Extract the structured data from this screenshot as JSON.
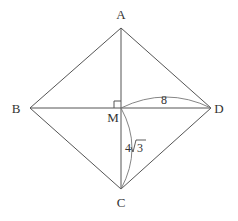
{
  "figure": {
    "type": "rhombus-with-diagonals",
    "points": {
      "A": "A",
      "B": "B",
      "C": "C",
      "D": "D",
      "M": "M"
    },
    "right_angle_at": "M",
    "measurements": {
      "MD": "8",
      "MC_coeff": "4",
      "MC_radicand": "3"
    }
  }
}
